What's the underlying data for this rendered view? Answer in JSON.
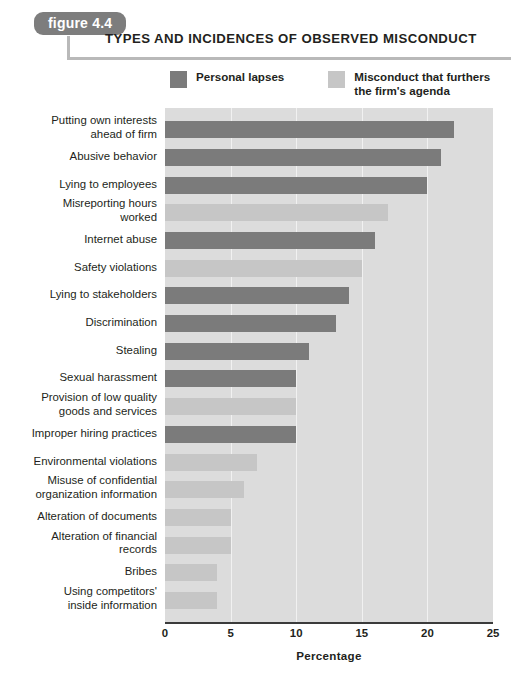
{
  "figure": {
    "badge": "figure 4.4",
    "title": "TYPES AND INCIDENCES OF OBSERVED MISCONDUCT"
  },
  "legend": {
    "position": "top",
    "items": [
      {
        "label": "Personal lapses",
        "color": "#7b7b7b",
        "key": "personal"
      },
      {
        "label": "Misconduct that furthers\nthe firm's agenda",
        "color": "#c6c6c6",
        "key": "firm"
      }
    ]
  },
  "colors": {
    "personal_lapses": "#7b7b7b",
    "firm_agenda": "#c6c6c6",
    "plot_background": "#dcdcdc",
    "gridline": "#f1f1f1",
    "axis": "#3b3b3b",
    "badge_background": "#7d7d7d",
    "rule": "#b9b9b9",
    "text": "#231f20"
  },
  "chart_data": {
    "type": "bar",
    "orientation": "horizontal",
    "title": "TYPES AND INCIDENCES OF OBSERVED MISCONDUCT",
    "xlabel": "Percentage",
    "ylabel": "",
    "xlim": [
      0,
      25
    ],
    "xticks": [
      0,
      5,
      10,
      15,
      20,
      25
    ],
    "grid": true,
    "legend": [
      "Personal lapses",
      "Misconduct that furthers the firm's agenda"
    ],
    "categories": [
      "Putting own interests\nahead of firm",
      "Abusive behavior",
      "Lying to employees",
      "Misreporting hours\nworked",
      "Internet abuse",
      "Safety violations",
      "Lying to stakeholders",
      "Discrimination",
      "Stealing",
      "Sexual harassment",
      "Provision of low quality\ngoods and services",
      "Improper hiring practices",
      "Environmental violations",
      "Misuse of confidential\norganization information",
      "Alteration of documents",
      "Alteration of financial\nrecords",
      "Bribes",
      "Using competitors'\ninside information"
    ],
    "values": [
      22,
      21,
      20,
      17,
      16,
      15,
      14,
      13,
      11,
      10,
      10,
      10,
      7,
      6,
      5,
      5,
      4,
      4
    ],
    "groups": [
      "personal",
      "personal",
      "personal",
      "firm",
      "personal",
      "firm",
      "personal",
      "personal",
      "personal",
      "personal",
      "firm",
      "personal",
      "firm",
      "firm",
      "firm",
      "firm",
      "firm",
      "firm"
    ]
  }
}
